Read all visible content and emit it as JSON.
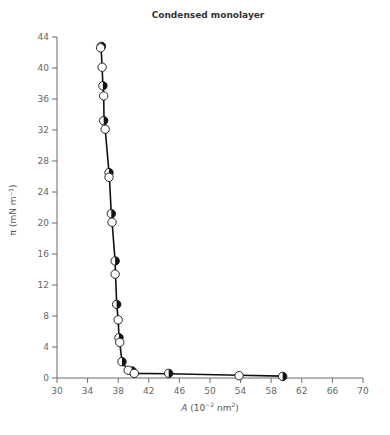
{
  "chart_data": {
    "type": "scatter",
    "title": "Condensed monolayer",
    "xlabel": "A (10^-2 nm^2)",
    "xlabel_parts": {
      "var": "A",
      "pre": " (10",
      "sup1": "−2",
      "mid": " nm",
      "sup2": "2",
      "post": ")"
    },
    "ylabel": "π (mN m⁻¹)",
    "xlim": [
      30,
      70
    ],
    "ylim": [
      0,
      44
    ],
    "x_ticks": [
      30,
      34,
      38,
      42,
      46,
      50,
      54,
      58,
      62,
      66,
      70
    ],
    "y_ticks": [
      0,
      4,
      8,
      12,
      16,
      20,
      24,
      28,
      32,
      36,
      40,
      44
    ],
    "grid": false,
    "legend": null,
    "series": [
      {
        "name": "half-filled markers",
        "marker": "half-filled circle",
        "points": [
          [
            35.8,
            42.8
          ],
          [
            36.0,
            37.7
          ],
          [
            36.1,
            33.2
          ],
          [
            36.8,
            26.5
          ],
          [
            37.1,
            21.2
          ],
          [
            37.6,
            15.1
          ],
          [
            37.8,
            9.5
          ],
          [
            38.1,
            5.2
          ],
          [
            38.5,
            2.1
          ],
          [
            39.8,
            0.9
          ],
          [
            44.6,
            0.6
          ],
          [
            59.5,
            0.2
          ]
        ]
      },
      {
        "name": "open markers",
        "marker": "open circle",
        "points": [
          [
            35.7,
            42.6
          ],
          [
            35.9,
            40.1
          ],
          [
            36.1,
            36.4
          ],
          [
            36.3,
            32.1
          ],
          [
            36.8,
            25.9
          ],
          [
            37.2,
            20.1
          ],
          [
            37.6,
            13.4
          ],
          [
            38.0,
            7.5
          ],
          [
            38.2,
            4.6
          ],
          [
            39.3,
            1.0
          ],
          [
            40.1,
            0.6
          ],
          [
            53.8,
            0.3
          ]
        ]
      }
    ],
    "curve": [
      [
        35.75,
        43.0
      ],
      [
        35.9,
        40.1
      ],
      [
        36.0,
        37.7
      ],
      [
        36.1,
        36.4
      ],
      [
        36.15,
        33.2
      ],
      [
        36.3,
        32.1
      ],
      [
        36.8,
        26.5
      ],
      [
        36.85,
        25.9
      ],
      [
        37.1,
        21.2
      ],
      [
        37.2,
        20.1
      ],
      [
        37.6,
        15.1
      ],
      [
        37.65,
        13.4
      ],
      [
        37.8,
        9.5
      ],
      [
        38.0,
        7.5
      ],
      [
        38.1,
        5.2
      ],
      [
        38.2,
        4.6
      ],
      [
        38.5,
        2.1
      ],
      [
        39.3,
        1.0
      ],
      [
        39.8,
        0.8
      ],
      [
        40.1,
        0.6
      ],
      [
        44.6,
        0.55
      ],
      [
        53.8,
        0.35
      ],
      [
        59.5,
        0.25
      ]
    ],
    "colors": {
      "axis": "#6b6b6b",
      "line": "#111111",
      "marker_fill": "#ffffff",
      "marker_dark": "#111111",
      "text": "#666666"
    }
  }
}
